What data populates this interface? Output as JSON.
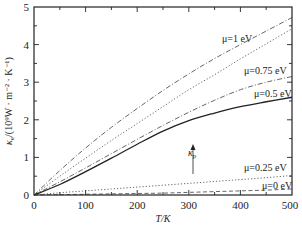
{
  "chart_data": {
    "type": "line",
    "title": "",
    "xlabel": "T/K",
    "ylabel": "κe/(10⁹W · m⁻² · K⁻¹)",
    "xlim": [
      0,
      500
    ],
    "ylim": [
      0,
      5
    ],
    "xticks": [
      0,
      100,
      200,
      300,
      400,
      500
    ],
    "yticks": [
      0,
      1,
      2,
      3,
      4,
      5
    ],
    "grid": false,
    "legend": "inline labels",
    "x": [
      0,
      50,
      100,
      150,
      200,
      250,
      300,
      350,
      400,
      450,
      500
    ],
    "series": [
      {
        "name": "μ=1 eV",
        "style": "dash-dot",
        "values": [
          0.0,
          0.65,
          1.25,
          1.8,
          2.3,
          2.78,
          3.22,
          3.63,
          4.0,
          4.36,
          4.72
        ]
      },
      {
        "name": "μ=0.75 eV",
        "style": "dotted",
        "values": [
          0.0,
          0.5,
          0.98,
          1.45,
          1.9,
          2.35,
          2.8,
          3.2,
          3.62,
          4.02,
          4.42
        ]
      },
      {
        "name": "μ=0.5 eV",
        "style": "dash-dot",
        "values": [
          0.0,
          0.35,
          0.72,
          1.1,
          1.48,
          1.85,
          2.2,
          2.52,
          2.8,
          3.0,
          3.15
        ]
      },
      {
        "name": "κp",
        "style": "solid",
        "values": [
          0.0,
          0.28,
          0.62,
          0.98,
          1.35,
          1.7,
          1.98,
          2.18,
          2.35,
          2.48,
          2.6
        ]
      },
      {
        "name": "μ=0.25 eV",
        "style": "dotted",
        "values": [
          0.0,
          0.06,
          0.11,
          0.16,
          0.21,
          0.26,
          0.31,
          0.36,
          0.41,
          0.46,
          0.52
        ]
      },
      {
        "name": "μ=0 eV",
        "style": "dashed",
        "values": [
          0.0,
          0.01,
          0.02,
          0.03,
          0.04,
          0.05,
          0.07,
          0.09,
          0.11,
          0.13,
          0.16
        ]
      }
    ],
    "annotations": [
      {
        "text": "μ=1 eV",
        "x": 415,
        "y": 4.05
      },
      {
        "text": "μ=0.75 eV",
        "x": 400,
        "y": 3.1
      },
      {
        "text": "μ=0.5 eV",
        "x": 415,
        "y": 2.55
      },
      {
        "text": "κp",
        "x": 300,
        "y": 0.8,
        "arrow_to": [
          300,
          2.0
        ]
      },
      {
        "text": "μ=0.25 eV",
        "x": 400,
        "y": 0.75
      },
      {
        "text": "μ=0 eV",
        "x": 420,
        "y": 0.3
      }
    ]
  },
  "axes": {
    "x_title": "T/K",
    "y_title_main": "κ",
    "y_title_sub": "e",
    "y_title_rest": "/(10⁹W · m⁻² · K⁻¹)",
    "x_tick_labels": [
      "0",
      "100",
      "200",
      "300",
      "400",
      "500"
    ],
    "y_tick_labels": [
      "0",
      "1",
      "2",
      "3",
      "4",
      "5"
    ]
  },
  "labels": {
    "mu1": "μ=1 eV",
    "mu075": "μ=0.75 eV",
    "mu05": "μ=0.5 eV",
    "kp_main": "κ",
    "kp_sub": "p",
    "mu025": "μ=0.25 eV",
    "mu0": "μ=0 eV"
  }
}
